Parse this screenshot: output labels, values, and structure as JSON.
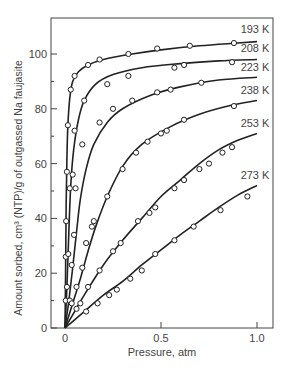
{
  "chart_data": {
    "type": "line",
    "title": "",
    "xlabel": "Pressure, atm",
    "ylabel": "Amount sorbed, cm³ (NTP)/g of outgassed Na faujasite",
    "xlim": [
      0,
      1.0
    ],
    "ylim": [
      0,
      110
    ],
    "xticks": [
      0,
      0.5,
      1.0
    ],
    "xtick_labels": [
      "0",
      "0.5",
      "1.0"
    ],
    "yticks": [
      0,
      20,
      40,
      60,
      80,
      100
    ],
    "ytick_labels": [
      "0",
      "20",
      "40",
      "60",
      "80",
      "100"
    ],
    "grid": false,
    "legend": "inline labels at right end of curves",
    "series": [
      {
        "name": "193 K",
        "curve": [
          [
            0,
            0
          ],
          [
            0.003,
            20
          ],
          [
            0.006,
            45
          ],
          [
            0.01,
            62
          ],
          [
            0.015,
            74
          ],
          [
            0.025,
            84
          ],
          [
            0.04,
            90
          ],
          [
            0.07,
            93.5
          ],
          [
            0.12,
            96
          ],
          [
            0.2,
            98
          ],
          [
            0.35,
            100
          ],
          [
            0.5,
            101.5
          ],
          [
            0.7,
            103
          ],
          [
            0.9,
            104
          ],
          [
            1.0,
            104.5
          ]
        ],
        "points": [
          [
            0.004,
            10
          ],
          [
            0.004,
            26
          ],
          [
            0.006,
            39
          ],
          [
            0.01,
            57
          ],
          [
            0.015,
            74
          ],
          [
            0.03,
            87
          ],
          [
            0.05,
            92
          ],
          [
            0.12,
            96
          ],
          [
            0.18,
            98
          ],
          [
            0.33,
            100
          ],
          [
            0.48,
            102
          ],
          [
            0.65,
            103
          ],
          [
            0.88,
            104
          ]
        ]
      },
      {
        "name": "208 K",
        "curve": [
          [
            0,
            0
          ],
          [
            0.01,
            15
          ],
          [
            0.02,
            35
          ],
          [
            0.03,
            52
          ],
          [
            0.045,
            65
          ],
          [
            0.07,
            76
          ],
          [
            0.1,
            83
          ],
          [
            0.16,
            89
          ],
          [
            0.25,
            92.5
          ],
          [
            0.4,
            95
          ],
          [
            0.6,
            96.5
          ],
          [
            0.8,
            97.5
          ],
          [
            1.0,
            98
          ]
        ],
        "points": [
          [
            0.01,
            15
          ],
          [
            0.017,
            27
          ],
          [
            0.025,
            51
          ],
          [
            0.04,
            56
          ],
          [
            0.05,
            72
          ],
          [
            0.1,
            83
          ],
          [
            0.22,
            89
          ],
          [
            0.33,
            92
          ],
          [
            0.57,
            95
          ],
          [
            0.62,
            96
          ],
          [
            0.87,
            97
          ]
        ]
      },
      {
        "name": "223 K",
        "curve": [
          [
            0,
            0
          ],
          [
            0.02,
            10
          ],
          [
            0.04,
            22
          ],
          [
            0.06,
            35
          ],
          [
            0.08,
            47
          ],
          [
            0.11,
            58
          ],
          [
            0.15,
            67
          ],
          [
            0.22,
            75
          ],
          [
            0.3,
            80
          ],
          [
            0.45,
            85
          ],
          [
            0.6,
            88
          ],
          [
            0.8,
            90.5
          ],
          [
            1.0,
            91.5
          ]
        ],
        "points": [
          [
            0.025,
            10
          ],
          [
            0.035,
            23
          ],
          [
            0.047,
            34
          ],
          [
            0.055,
            51
          ],
          [
            0.09,
            67
          ],
          [
            0.18,
            75
          ],
          [
            0.25,
            80
          ],
          [
            0.35,
            83
          ],
          [
            0.48,
            86
          ],
          [
            0.55,
            87
          ],
          [
            0.71,
            89.5
          ]
        ]
      },
      {
        "name": "238 K",
        "curve": [
          [
            0,
            0
          ],
          [
            0.04,
            9
          ],
          [
            0.08,
            18
          ],
          [
            0.12,
            28
          ],
          [
            0.16,
            37
          ],
          [
            0.22,
            48
          ],
          [
            0.3,
            59
          ],
          [
            0.4,
            67
          ],
          [
            0.55,
            73.5
          ],
          [
            0.7,
            78
          ],
          [
            0.85,
            81
          ],
          [
            1.0,
            83
          ]
        ],
        "points": [
          [
            0.035,
            9
          ],
          [
            0.06,
            15
          ],
          [
            0.09,
            22
          ],
          [
            0.11,
            31
          ],
          [
            0.14,
            37
          ],
          [
            0.15,
            39
          ],
          [
            0.22,
            48
          ],
          [
            0.3,
            58
          ],
          [
            0.37,
            64
          ],
          [
            0.43,
            68
          ],
          [
            0.5,
            71
          ],
          [
            0.53,
            72
          ],
          [
            0.62,
            76
          ],
          [
            0.88,
            81
          ]
        ]
      },
      {
        "name": "253 K",
        "curve": [
          [
            0,
            0
          ],
          [
            0.05,
            6
          ],
          [
            0.1,
            12
          ],
          [
            0.2,
            23
          ],
          [
            0.3,
            32
          ],
          [
            0.4,
            40
          ],
          [
            0.5,
            48
          ],
          [
            0.6,
            54
          ],
          [
            0.7,
            60
          ],
          [
            0.8,
            65
          ],
          [
            0.9,
            68.5
          ],
          [
            1.0,
            71
          ]
        ],
        "points": [
          [
            0.06,
            7
          ],
          [
            0.08,
            9
          ],
          [
            0.12,
            15
          ],
          [
            0.18,
            21
          ],
          [
            0.25,
            28
          ],
          [
            0.29,
            31
          ],
          [
            0.38,
            39
          ],
          [
            0.44,
            42
          ],
          [
            0.47,
            44
          ],
          [
            0.57,
            51
          ],
          [
            0.62,
            54
          ],
          [
            0.7,
            58
          ],
          [
            0.75,
            60
          ],
          [
            0.82,
            64
          ],
          [
            0.87,
            66
          ]
        ]
      },
      {
        "name": "273 K",
        "curve": [
          [
            0,
            0
          ],
          [
            0.05,
            3
          ],
          [
            0.1,
            6
          ],
          [
            0.2,
            12
          ],
          [
            0.3,
            17
          ],
          [
            0.4,
            23
          ],
          [
            0.5,
            28.5
          ],
          [
            0.6,
            34
          ],
          [
            0.7,
            39
          ],
          [
            0.8,
            44
          ],
          [
            0.9,
            48.5
          ],
          [
            1.0,
            52
          ]
        ],
        "points": [
          [
            0.11,
            6
          ],
          [
            0.17,
            9
          ],
          [
            0.23,
            12
          ],
          [
            0.27,
            14
          ],
          [
            0.34,
            18
          ],
          [
            0.4,
            21
          ],
          [
            0.47,
            27
          ],
          [
            0.57,
            32
          ],
          [
            0.67,
            37
          ],
          [
            0.81,
            43
          ],
          [
            0.95,
            48
          ]
        ]
      }
    ]
  }
}
